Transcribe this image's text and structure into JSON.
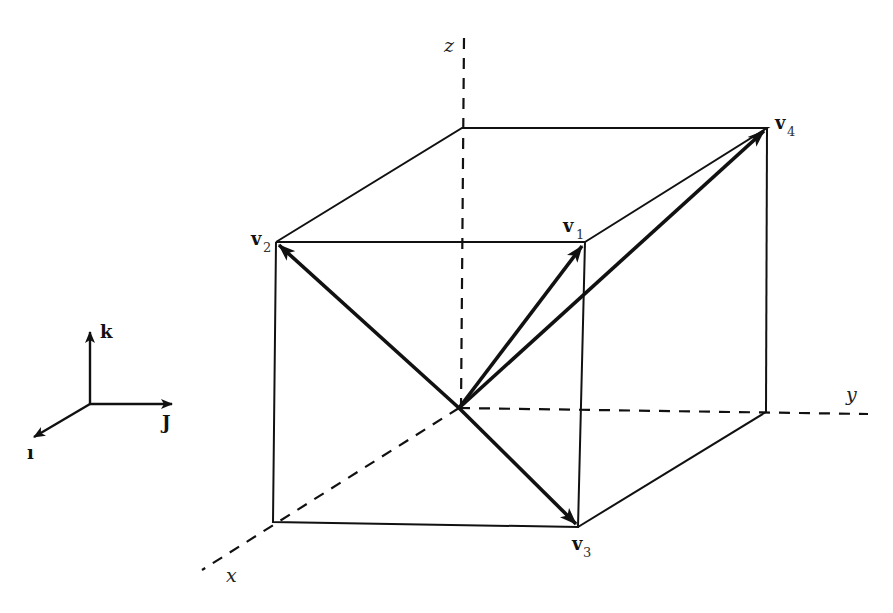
{
  "diagram": {
    "type": "3d-cube-vectors",
    "axes": {
      "x_label": "x",
      "y_label": "y",
      "z_label": "z"
    },
    "basis": {
      "i_label": "ı",
      "j_label": "J",
      "k_label": "k"
    },
    "vectors": [
      {
        "name": "v",
        "sub": "1"
      },
      {
        "name": "v",
        "sub": "2"
      },
      {
        "name": "v",
        "sub": "3"
      },
      {
        "name": "v",
        "sub": "4"
      }
    ],
    "colors": {
      "line": "#111111",
      "background": "#ffffff"
    }
  }
}
